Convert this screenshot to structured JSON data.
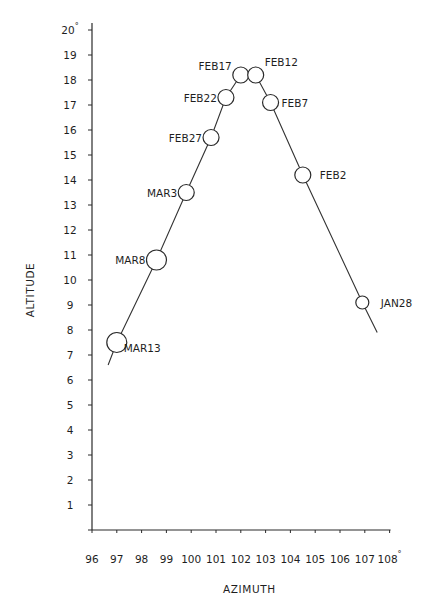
{
  "chart_data": {
    "type": "scatter",
    "title": "",
    "xlabel": "AZIMUTH",
    "ylabel": "ALTITUDE",
    "xlim": [
      96,
      108
    ],
    "ylim": [
      0,
      20
    ],
    "x_ticks": [
      96,
      97,
      98,
      99,
      100,
      101,
      102,
      103,
      104,
      105,
      106,
      107,
      108
    ],
    "y_ticks": [
      1,
      2,
      3,
      4,
      5,
      6,
      7,
      8,
      9,
      10,
      11,
      12,
      13,
      14,
      15,
      16,
      17,
      18,
      19,
      20
    ],
    "x_max_label_suffix": "°",
    "y_max_label_suffix": "°",
    "grid": false,
    "legend": null,
    "connected_line": true,
    "points": [
      {
        "label": "MAR13",
        "azimuth": 97.0,
        "altitude": 7.5,
        "r": 10,
        "label_side": "right-below"
      },
      {
        "label": "MAR8",
        "azimuth": 98.6,
        "altitude": 10.8,
        "r": 10,
        "label_side": "left"
      },
      {
        "label": "MAR3",
        "azimuth": 99.8,
        "altitude": 13.5,
        "r": 8,
        "label_side": "left"
      },
      {
        "label": "FEB27",
        "azimuth": 100.8,
        "altitude": 15.7,
        "r": 8,
        "label_side": "left"
      },
      {
        "label": "FEB22",
        "azimuth": 101.4,
        "altitude": 17.3,
        "r": 8,
        "label_side": "left"
      },
      {
        "label": "FEB17",
        "azimuth": 102.0,
        "altitude": 18.2,
        "r": 8,
        "label_side": "left-above"
      },
      {
        "label": "FEB12",
        "azimuth": 102.6,
        "altitude": 18.2,
        "r": 8,
        "label_side": "right-above"
      },
      {
        "label": "FEB7",
        "azimuth": 103.2,
        "altitude": 17.1,
        "r": 8,
        "label_side": "right"
      },
      {
        "label": "FEB2",
        "azimuth": 104.5,
        "altitude": 14.2,
        "r": 8,
        "label_side": "right"
      },
      {
        "label": "JAN28",
        "azimuth": 106.9,
        "altitude": 9.1,
        "r": 6.5,
        "label_side": "right"
      }
    ],
    "line_extensions": {
      "start": {
        "azimuth": 96.65,
        "altitude": 6.6
      },
      "end": {
        "azimuth": 107.5,
        "altitude": 7.9
      }
    }
  },
  "colors": {
    "ink": "#2a2a2a",
    "background": "#ffffff"
  }
}
